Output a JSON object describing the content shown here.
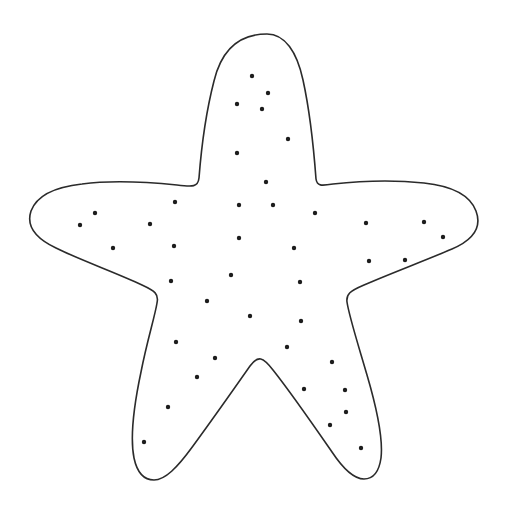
{
  "figure": {
    "style": "black line art on white background",
    "canvas": {
      "width": 506,
      "height": 513
    },
    "background_color": "#ffffff",
    "stroke_color": "#2b2b2b",
    "stroke_width": 1.6,
    "speckle_color": "#1c1c1c",
    "speckle_radius": 2.2,
    "arm_count": 5
  },
  "outline": {
    "description": "Five-armed rounded star silhouette",
    "tips": [
      {
        "name": "top-arm-tip",
        "x": 267,
        "y": 34
      },
      {
        "name": "right-arm-tip",
        "x": 477,
        "y": 233
      },
      {
        "name": "lower-right-arm-tip",
        "x": 369,
        "y": 476
      },
      {
        "name": "lower-left-arm-tip",
        "x": 147,
        "y": 478
      },
      {
        "name": "left-arm-tip",
        "x": 28,
        "y": 223
      }
    ],
    "notches": [
      {
        "name": "upper-right-notch",
        "x": 316,
        "y": 185
      },
      {
        "name": "lower-right-notch",
        "x": 348,
        "y": 300
      },
      {
        "name": "bottom-notch",
        "x": 257,
        "y": 368
      },
      {
        "name": "lower-left-notch",
        "x": 143,
        "y": 307
      },
      {
        "name": "upper-left-notch",
        "x": 170,
        "y": 188
      }
    ],
    "path": "M 267 34 C 285 34 297 52 303 80 C 310 112 314 152 316 179 C 317 186 321 186 333 184 C 360 181 396 180 424 183 C 452 186 470 195 476 211 C 482 227 473 240 452 249 C 424 261 389 274 364 285 C 350 291 346 294 347 302 C 349 316 358 344 367 375 C 377 409 383 441 381 458 C 379 472 373 479 364 479 C 354 479 344 470 332 452 C 314 426 292 394 273 370 C 263 357 258 355 250 366 C 236 386 212 420 193 446 C 177 468 165 480 154 480 C 144 480 137 472 134 458 C 130 438 134 405 141 372 C 147 341 155 316 157 303 C 159 294 155 291 142 285 C 117 273 80 260 56 248 C 35 238 26 226 31 211 C 37 195 55 187 82 184 C 111 180 148 182 177 185 C 193 187 198 187 199 178 C 201 152 206 112 214 81 C 221 52 238 34 267 34 Z"
  },
  "speckles": [
    {
      "x": 252,
      "y": 76
    },
    {
      "x": 268,
      "y": 93
    },
    {
      "x": 237,
      "y": 104
    },
    {
      "x": 262,
      "y": 109
    },
    {
      "x": 288,
      "y": 139
    },
    {
      "x": 237,
      "y": 153
    },
    {
      "x": 266,
      "y": 182
    },
    {
      "x": 95,
      "y": 213
    },
    {
      "x": 175,
      "y": 202
    },
    {
      "x": 239,
      "y": 205
    },
    {
      "x": 273,
      "y": 205
    },
    {
      "x": 315,
      "y": 213
    },
    {
      "x": 80,
      "y": 225
    },
    {
      "x": 150,
      "y": 224
    },
    {
      "x": 366,
      "y": 223
    },
    {
      "x": 424,
      "y": 222
    },
    {
      "x": 443,
      "y": 237
    },
    {
      "x": 113,
      "y": 248
    },
    {
      "x": 174,
      "y": 246
    },
    {
      "x": 239,
      "y": 238
    },
    {
      "x": 294,
      "y": 248
    },
    {
      "x": 405,
      "y": 260
    },
    {
      "x": 369,
      "y": 261
    },
    {
      "x": 171,
      "y": 281
    },
    {
      "x": 231,
      "y": 275
    },
    {
      "x": 300,
      "y": 282
    },
    {
      "x": 207,
      "y": 301
    },
    {
      "x": 250,
      "y": 316
    },
    {
      "x": 301,
      "y": 321
    },
    {
      "x": 176,
      "y": 342
    },
    {
      "x": 287,
      "y": 347
    },
    {
      "x": 215,
      "y": 358
    },
    {
      "x": 197,
      "y": 377
    },
    {
      "x": 332,
      "y": 362
    },
    {
      "x": 304,
      "y": 389
    },
    {
      "x": 345,
      "y": 390
    },
    {
      "x": 346,
      "y": 412
    },
    {
      "x": 168,
      "y": 407
    },
    {
      "x": 330,
      "y": 425
    },
    {
      "x": 144,
      "y": 442
    },
    {
      "x": 361,
      "y": 448
    }
  ]
}
